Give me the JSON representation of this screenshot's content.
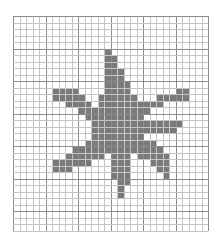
{
  "figure": {
    "grid": {
      "cols": 30,
      "rows": 33,
      "cell_px": 6.5,
      "major_every": 5
    },
    "colors": {
      "background": "#ffffff",
      "minor_line": "#c4c4c4",
      "major_line": "#8d8d8d",
      "fill": "#7a7a7a"
    },
    "filled_rows": [
      {
        "row": 5,
        "spans": [
          [
            14,
            14
          ]
        ]
      },
      {
        "row": 6,
        "spans": [
          [
            14,
            15
          ]
        ]
      },
      {
        "row": 7,
        "spans": [
          [
            14,
            15
          ]
        ]
      },
      {
        "row": 8,
        "spans": [
          [
            14,
            16
          ]
        ]
      },
      {
        "row": 9,
        "spans": [
          [
            14,
            16
          ]
        ]
      },
      {
        "row": 10,
        "spans": [
          [
            14,
            17
          ]
        ]
      },
      {
        "row": 11,
        "spans": [
          [
            6,
            9
          ],
          [
            14,
            17
          ],
          [
            25,
            26
          ]
        ]
      },
      {
        "row": 12,
        "spans": [
          [
            6,
            10
          ],
          [
            13,
            18
          ],
          [
            22,
            26
          ]
        ]
      },
      {
        "row": 13,
        "spans": [
          [
            8,
            11
          ],
          [
            13,
            22
          ]
        ]
      },
      {
        "row": 14,
        "spans": [
          [
            10,
            20
          ]
        ]
      },
      {
        "row": 15,
        "spans": [
          [
            11,
            19
          ]
        ]
      },
      {
        "row": 16,
        "spans": [
          [
            12,
            25
          ]
        ]
      },
      {
        "row": 17,
        "spans": [
          [
            12,
            24
          ]
        ]
      },
      {
        "row": 18,
        "spans": [
          [
            12,
            19
          ]
        ]
      },
      {
        "row": 19,
        "spans": [
          [
            11,
            21
          ]
        ]
      },
      {
        "row": 20,
        "spans": [
          [
            9,
            22
          ]
        ]
      },
      {
        "row": 21,
        "spans": [
          [
            8,
            13
          ],
          [
            15,
            17
          ],
          [
            19,
            23
          ]
        ]
      },
      {
        "row": 22,
        "spans": [
          [
            6,
            11
          ],
          [
            15,
            17
          ],
          [
            21,
            23
          ]
        ]
      },
      {
        "row": 23,
        "spans": [
          [
            6,
            8
          ],
          [
            15,
            17
          ],
          [
            22,
            23
          ]
        ]
      },
      {
        "row": 24,
        "spans": [
          [
            15,
            17
          ],
          [
            23,
            23
          ]
        ]
      },
      {
        "row": 25,
        "spans": [
          [
            16,
            17
          ]
        ]
      },
      {
        "row": 26,
        "spans": [
          [
            16,
            16
          ]
        ]
      },
      {
        "row": 27,
        "spans": [
          [
            16,
            16
          ]
        ]
      }
    ]
  }
}
